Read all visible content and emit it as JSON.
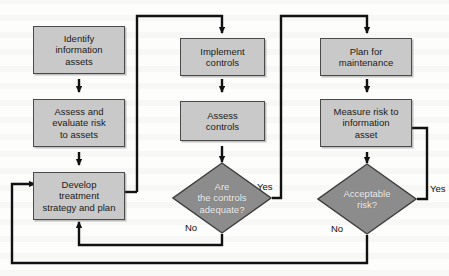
{
  "diagram": {
    "type": "flowchart",
    "colors": {
      "process_fill": "#c9c9c9",
      "decision_fill": "#8c8c8c",
      "stroke": "#1a1a1a",
      "background": "#fdfdfc",
      "text_dark": "#1a1a1a",
      "text_light": "#f2f2f2"
    },
    "nodes": [
      {
        "id": "identify",
        "shape": "process",
        "label": "Identify\ninformation\nassets"
      },
      {
        "id": "assess_eval",
        "shape": "process",
        "label": "Assess and\nevaluate risk\nto assets"
      },
      {
        "id": "develop",
        "shape": "process",
        "label": "Develop\ntreatment\nstrategy and plan"
      },
      {
        "id": "implement",
        "shape": "process",
        "label": "Implement\ncontrols"
      },
      {
        "id": "assess_controls",
        "shape": "process",
        "label": "Assess\ncontrols"
      },
      {
        "id": "controls_adequate",
        "shape": "decision",
        "label": "Are\nthe controls\nadequate?"
      },
      {
        "id": "plan_maint",
        "shape": "process",
        "label": "Plan for\nmaintenance"
      },
      {
        "id": "measure_risk",
        "shape": "process",
        "label": "Measure risk to\ninformation\nasset"
      },
      {
        "id": "acceptable_risk",
        "shape": "decision",
        "label": "Acceptable\nrisk?"
      }
    ],
    "edge_labels": [
      {
        "id": "controls_yes",
        "text": "Yes"
      },
      {
        "id": "controls_no",
        "text": "No"
      },
      {
        "id": "risk_yes",
        "text": "Yes"
      },
      {
        "id": "risk_no",
        "text": "No"
      }
    ],
    "edges": [
      {
        "from": "identify",
        "to": "assess_eval",
        "label": ""
      },
      {
        "from": "assess_eval",
        "to": "develop",
        "label": ""
      },
      {
        "from": "develop",
        "to": "implement",
        "label": ""
      },
      {
        "from": "implement",
        "to": "assess_controls",
        "label": ""
      },
      {
        "from": "assess_controls",
        "to": "controls_adequate",
        "label": ""
      },
      {
        "from": "controls_adequate",
        "to": "plan_maint",
        "label": "Yes"
      },
      {
        "from": "controls_adequate",
        "to": "develop",
        "label": "No"
      },
      {
        "from": "plan_maint",
        "to": "measure_risk",
        "label": ""
      },
      {
        "from": "measure_risk",
        "to": "acceptable_risk",
        "label": ""
      },
      {
        "from": "acceptable_risk",
        "to": "measure_risk",
        "label": "Yes"
      },
      {
        "from": "acceptable_risk",
        "to": "develop",
        "label": "No"
      }
    ]
  }
}
